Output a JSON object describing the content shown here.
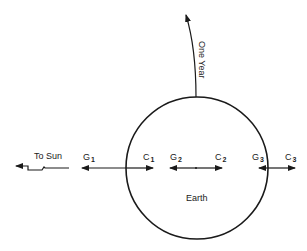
{
  "diagram": {
    "type": "tidal-force-diagram",
    "earth": {
      "label": "Earth"
    },
    "orbit_arrow": {
      "label": "One Year"
    },
    "sun_direction": {
      "label": "To Sun"
    },
    "points": [
      {
        "g_label": "G",
        "g_sub": "1",
        "c_label": "C",
        "c_sub": "1"
      },
      {
        "g_label": "G",
        "g_sub": "2",
        "c_label": "C",
        "c_sub": "2"
      },
      {
        "g_label": "G",
        "g_sub": "3",
        "c_label": "C",
        "c_sub": "3"
      }
    ],
    "colors": {
      "ink": "#1a1a1a",
      "background": "#ffffff"
    }
  }
}
